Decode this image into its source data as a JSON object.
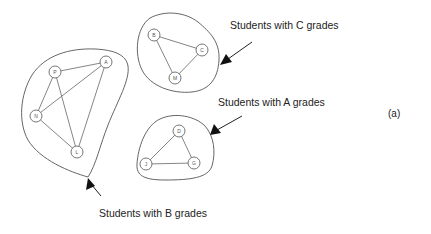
{
  "figure": {
    "label": "(a)"
  },
  "groups": [
    {
      "id": "B",
      "caption": "Students with B grades",
      "nodes": [
        {
          "id": "P",
          "label": "P"
        },
        {
          "id": "A",
          "label": "A"
        },
        {
          "id": "N",
          "label": "N"
        },
        {
          "id": "L",
          "label": "L"
        }
      ],
      "edges": [
        [
          "P",
          "A"
        ],
        [
          "P",
          "N"
        ],
        [
          "P",
          "L"
        ],
        [
          "A",
          "N"
        ],
        [
          "A",
          "L"
        ],
        [
          "N",
          "L"
        ]
      ]
    },
    {
      "id": "C",
      "caption": "Students with C grades",
      "nodes": [
        {
          "id": "B",
          "label": "B"
        },
        {
          "id": "C",
          "label": "C"
        },
        {
          "id": "M",
          "label": "M"
        }
      ],
      "edges": [
        [
          "B",
          "C"
        ],
        [
          "B",
          "M"
        ],
        [
          "C",
          "M"
        ]
      ]
    },
    {
      "id": "A",
      "caption": "Students with A grades",
      "nodes": [
        {
          "id": "D",
          "label": "D"
        },
        {
          "id": "J",
          "label": "J"
        },
        {
          "id": "G",
          "label": "G"
        }
      ],
      "edges": [
        [
          "D",
          "J"
        ],
        [
          "D",
          "G"
        ],
        [
          "J",
          "G"
        ]
      ]
    }
  ],
  "colors": {
    "stroke": "#666666",
    "text": "#222222",
    "background": "#ffffff"
  }
}
